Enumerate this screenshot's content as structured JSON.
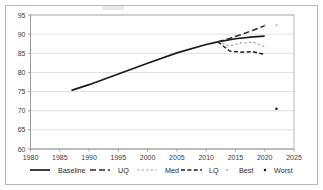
{
  "chart_data": {
    "type": "line",
    "title": "",
    "subtitle": "",
    "xlabel": "",
    "ylabel": "",
    "xlim": [
      1980,
      2025
    ],
    "ylim": [
      60,
      95
    ],
    "xticks": [
      1980,
      1985,
      1990,
      1995,
      2000,
      2005,
      2010,
      2015,
      2020,
      2025
    ],
    "yticks": [
      60,
      65,
      70,
      75,
      80,
      85,
      90,
      95
    ],
    "grid": "horizontal",
    "legend_position": "bottom",
    "series": [
      {
        "name": "Baseline",
        "style": "solid",
        "color": "#1a1a1a",
        "x": [
          1987,
          1990,
          1995,
          2000,
          2005,
          2010,
          2012,
          2015,
          2018,
          2020
        ],
        "values": [
          75.3,
          76.8,
          79.6,
          82.4,
          85.1,
          87.3,
          88.0,
          88.8,
          89.3,
          89.5
        ]
      },
      {
        "name": "UQ",
        "style": "dashed",
        "color": "#2b2b2b",
        "x": [
          2012,
          2014,
          2016,
          2018,
          2020
        ],
        "values": [
          88.0,
          88.9,
          89.9,
          91.0,
          92.2
        ]
      },
      {
        "name": "Med",
        "style": "dotted",
        "color": "#a8a8a8",
        "x": [
          2012,
          2014,
          2016,
          2018,
          2020
        ],
        "values": [
          88.0,
          86.9,
          87.7,
          87.9,
          86.7
        ]
      },
      {
        "name": "LQ",
        "style": "dash-dash",
        "color": "#1f1f1f",
        "x": [
          2012,
          2014,
          2016,
          2018,
          2020
        ],
        "values": [
          88.0,
          85.6,
          85.3,
          85.4,
          84.7
        ]
      },
      {
        "name": "Best",
        "style": "marker",
        "color": "#aeaeae",
        "x": [
          2020,
          2022
        ],
        "values": [
          92.3,
          92.3
        ]
      },
      {
        "name": "Worst",
        "style": "marker",
        "color": "#1a1a1a",
        "x": [
          2022
        ],
        "values": [
          70.5
        ]
      }
    ]
  },
  "legend": {
    "items": [
      {
        "label": "Baseline",
        "swatch": "solid-line"
      },
      {
        "label": "UQ",
        "swatch": "dashed-line"
      },
      {
        "label": "Med",
        "swatch": "dotted-line"
      },
      {
        "label": "LQ",
        "swatch": "dash-dash-line"
      },
      {
        "label": "Best",
        "swatch": "small-dot-marker"
      },
      {
        "label": "Worst",
        "swatch": "dot-marker"
      }
    ]
  },
  "axes": {
    "y_tick_labels": [
      "95",
      "90",
      "85",
      "80",
      "75",
      "70",
      "65",
      "60"
    ],
    "x_tick_labels": [
      "1980",
      "1985",
      "1990",
      "1995",
      "2000",
      "2005",
      "2010",
      "2015",
      "2020",
      "2025"
    ]
  },
  "colors": {
    "grid": "#c9c9c9",
    "axis": "#8a8a8a",
    "frame": "#b9b9b9",
    "baseline": "#1a1a1a",
    "med": "#a8a8a8",
    "best": "#aeaeae"
  }
}
